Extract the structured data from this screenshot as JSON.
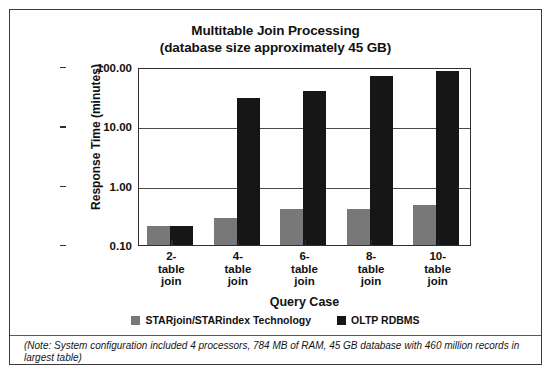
{
  "figure": {
    "title_line_1": "Multitable Join Processing",
    "title_line_2": "(database size approximately 45 GB)",
    "footnote": "(Note:  System configuration included 4 processors, 784 MB of RAM, 45 GB database with 460 million records in largest table)"
  },
  "chart_data": {
    "type": "bar",
    "title": "Multitable Join Processing (database size approximately 45 GB)",
    "xlabel": "Query Case",
    "ylabel": "Response Time (minutes)",
    "yscale": "log",
    "ylim": [
      0.1,
      100.0
    ],
    "ytick_labels": [
      "100.00",
      "10.00",
      "1.00",
      "0.10"
    ],
    "ytick_values": [
      100.0,
      10.0,
      1.0,
      0.1
    ],
    "grid": true,
    "legend_position": "bottom",
    "categories": [
      "2-\ntable\njoin",
      "4-\ntable\njoin",
      "6-\ntable\njoin",
      "8-\ntable\njoin",
      "10-\ntable\njoin"
    ],
    "category_labels": [
      [
        "2-",
        "table",
        "join"
      ],
      [
        "4-",
        "table",
        "join"
      ],
      [
        "6-",
        "table",
        "join"
      ],
      [
        "8-",
        "table",
        "join"
      ],
      [
        "10-",
        "table",
        "join"
      ]
    ],
    "series": [
      {
        "name": "STARjoin/STARindex Technology",
        "color": "#787878",
        "values": [
          0.21,
          0.29,
          0.41,
          0.4,
          0.48
        ]
      },
      {
        "name": "OLTP RDBMS",
        "color": "#161616",
        "values": [
          0.21,
          30.0,
          40.0,
          70.0,
          85.0
        ]
      }
    ]
  }
}
